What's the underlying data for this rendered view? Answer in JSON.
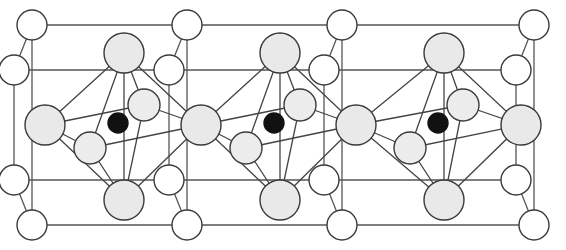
{
  "figure": {
    "kind": "ball-and-stick unit-cell packing diagram",
    "background_color": "#ffffff",
    "width": 566,
    "height": 250
  },
  "style": {
    "lattice_line_color": "#555555",
    "lattice_line_width": 1.3,
    "bond_line_color": "#444444",
    "bond_line_width": 1.3,
    "atom_outline_color": "#3a3a3a",
    "atom_outline_width": 1.4
  },
  "atom_types": [
    {
      "id": "large-gray",
      "label": "Large gray sphere",
      "fill": "#e9e9e9",
      "stroke": "#3a3a3a",
      "radius": 20
    },
    {
      "id": "medium-gray",
      "label": "Medium gray sphere",
      "fill": "#ececec",
      "stroke": "#3a3a3a",
      "radius": 16
    },
    {
      "id": "white",
      "label": "Small white sphere",
      "fill": "#ffffff",
      "stroke": "#3a3a3a",
      "radius": 15
    },
    {
      "id": "black",
      "label": "Small black sphere",
      "fill": "#111111",
      "stroke": "#111111",
      "radius": 10
    }
  ],
  "lattice_lines": [
    {
      "name": "top-edge",
      "x1": 32,
      "y1": 25,
      "x2": 534,
      "y2": 25
    },
    {
      "name": "upper-inner-edge",
      "x1": 14,
      "y1": 70,
      "x2": 516,
      "y2": 70
    },
    {
      "name": "lower-inner-edge",
      "x1": 14,
      "y1": 180,
      "x2": 516,
      "y2": 180
    },
    {
      "name": "bottom-edge",
      "x1": 32,
      "y1": 225,
      "x2": 534,
      "y2": 225
    },
    {
      "name": "left-vertical-back",
      "x1": 32,
      "y1": 25,
      "x2": 32,
      "y2": 225
    },
    {
      "name": "left-vertical-front",
      "x1": 14,
      "y1": 70,
      "x2": 14,
      "y2": 180
    },
    {
      "name": "right-vertical-back",
      "x1": 534,
      "y1": 25,
      "x2": 534,
      "y2": 225
    },
    {
      "name": "right-vertical-front",
      "x1": 516,
      "y1": 70,
      "x2": 516,
      "y2": 180
    },
    {
      "name": "mid-vertical-1-back",
      "x1": 187,
      "y1": 25,
      "x2": 187,
      "y2": 225
    },
    {
      "name": "mid-vertical-1-front",
      "x1": 169,
      "y1": 70,
      "x2": 169,
      "y2": 180
    },
    {
      "name": "mid-vertical-2-back",
      "x1": 342,
      "y1": 25,
      "x2": 342,
      "y2": 225
    },
    {
      "name": "mid-vertical-2-front",
      "x1": 324,
      "y1": 70,
      "x2": 324,
      "y2": 180
    },
    {
      "name": "depth-left-top",
      "x1": 32,
      "y1": 25,
      "x2": 14,
      "y2": 70
    },
    {
      "name": "depth-left-bottom",
      "x1": 32,
      "y1": 225,
      "x2": 14,
      "y2": 180
    },
    {
      "name": "depth-right-top",
      "x1": 534,
      "y1": 25,
      "x2": 516,
      "y2": 70
    },
    {
      "name": "depth-right-bottom",
      "x1": 534,
      "y1": 225,
      "x2": 516,
      "y2": 180
    },
    {
      "name": "depth-mid1-top",
      "x1": 187,
      "y1": 25,
      "x2": 169,
      "y2": 70
    },
    {
      "name": "depth-mid1-bottom",
      "x1": 187,
      "y1": 225,
      "x2": 169,
      "y2": 180
    },
    {
      "name": "depth-mid2-top",
      "x1": 342,
      "y1": 25,
      "x2": 324,
      "y2": 70
    },
    {
      "name": "depth-mid2-bottom",
      "x1": 342,
      "y1": 225,
      "x2": 324,
      "y2": 180
    }
  ],
  "atoms": [
    {
      "name": "corner-white-top-left",
      "type": "white",
      "cx": 32,
      "cy": 25
    },
    {
      "name": "corner-white-top-mid1",
      "type": "white",
      "cx": 187,
      "cy": 25
    },
    {
      "name": "corner-white-top-mid2",
      "type": "white",
      "cx": 342,
      "cy": 25
    },
    {
      "name": "corner-white-top-right",
      "type": "white",
      "cx": 534,
      "cy": 25
    },
    {
      "name": "corner-white-upper-left",
      "type": "white",
      "cx": 14,
      "cy": 70
    },
    {
      "name": "corner-white-upper-mid1",
      "type": "white",
      "cx": 169,
      "cy": 70
    },
    {
      "name": "corner-white-upper-mid2",
      "type": "white",
      "cx": 324,
      "cy": 70
    },
    {
      "name": "corner-white-upper-right",
      "type": "white",
      "cx": 516,
      "cy": 70
    },
    {
      "name": "corner-white-lower-left",
      "type": "white",
      "cx": 14,
      "cy": 180
    },
    {
      "name": "corner-white-lower-mid1",
      "type": "white",
      "cx": 169,
      "cy": 180
    },
    {
      "name": "corner-white-lower-mid2",
      "type": "white",
      "cx": 324,
      "cy": 180
    },
    {
      "name": "corner-white-lower-right",
      "type": "white",
      "cx": 516,
      "cy": 180
    },
    {
      "name": "corner-white-bottom-left",
      "type": "white",
      "cx": 32,
      "cy": 225
    },
    {
      "name": "corner-white-bottom-mid1",
      "type": "white",
      "cx": 187,
      "cy": 225
    },
    {
      "name": "corner-white-bottom-mid2",
      "type": "white",
      "cx": 342,
      "cy": 225
    },
    {
      "name": "corner-white-bottom-right",
      "type": "white",
      "cx": 534,
      "cy": 225
    },
    {
      "name": "hub-gray-left-edge",
      "type": "large-gray",
      "cx": 45,
      "cy": 125
    },
    {
      "name": "hub-gray-mid1",
      "type": "large-gray",
      "cx": 201,
      "cy": 125
    },
    {
      "name": "hub-gray-mid2",
      "type": "large-gray",
      "cx": 356,
      "cy": 125
    },
    {
      "name": "hub-gray-right-edge",
      "type": "large-gray",
      "cx": 521,
      "cy": 125
    },
    {
      "name": "apex-gray-cell1",
      "type": "large-gray",
      "cx": 124,
      "cy": 53
    },
    {
      "name": "apex-gray-cell2",
      "type": "large-gray",
      "cx": 280,
      "cy": 53
    },
    {
      "name": "apex-gray-cell3",
      "type": "large-gray",
      "cx": 444,
      "cy": 53
    },
    {
      "name": "base-gray-cell1",
      "type": "large-gray",
      "cx": 124,
      "cy": 200
    },
    {
      "name": "base-gray-cell2",
      "type": "large-gray",
      "cx": 280,
      "cy": 200
    },
    {
      "name": "base-gray-cell3",
      "type": "large-gray",
      "cx": 444,
      "cy": 200
    },
    {
      "name": "inner-gray-upper-cell1",
      "type": "medium-gray",
      "cx": 144,
      "cy": 105
    },
    {
      "name": "inner-gray-upper-cell2",
      "type": "medium-gray",
      "cx": 300,
      "cy": 105
    },
    {
      "name": "inner-gray-upper-cell3",
      "type": "medium-gray",
      "cx": 463,
      "cy": 105
    },
    {
      "name": "inner-gray-lower-cell1",
      "type": "medium-gray",
      "cx": 90,
      "cy": 148
    },
    {
      "name": "inner-gray-lower-cell2",
      "type": "medium-gray",
      "cx": 246,
      "cy": 148
    },
    {
      "name": "inner-gray-lower-cell3",
      "type": "medium-gray",
      "cx": 410,
      "cy": 148
    },
    {
      "name": "center-black-cell1",
      "type": "black",
      "cx": 118,
      "cy": 123
    },
    {
      "name": "center-black-cell2",
      "type": "black",
      "cx": 274,
      "cy": 123
    },
    {
      "name": "center-black-cell3",
      "type": "black",
      "cx": 438,
      "cy": 123
    }
  ],
  "bonds": [
    {
      "name": "bond-c1-apex-hubL",
      "x1": 124,
      "y1": 53,
      "x2": 45,
      "y2": 125
    },
    {
      "name": "bond-c1-apex-hubR",
      "x1": 124,
      "y1": 53,
      "x2": 201,
      "y2": 125
    },
    {
      "name": "bond-c1-apex-innerUp",
      "x1": 124,
      "y1": 53,
      "x2": 144,
      "y2": 105
    },
    {
      "name": "bond-c1-apex-innerLo",
      "x1": 124,
      "y1": 53,
      "x2": 90,
      "y2": 148
    },
    {
      "name": "bond-c1-apex-base",
      "x1": 124,
      "y1": 53,
      "x2": 124,
      "y2": 200
    },
    {
      "name": "bond-c1-base-hubL",
      "x1": 124,
      "y1": 200,
      "x2": 45,
      "y2": 125
    },
    {
      "name": "bond-c1-base-hubR",
      "x1": 124,
      "y1": 200,
      "x2": 201,
      "y2": 125
    },
    {
      "name": "bond-c1-base-innerUp",
      "x1": 124,
      "y1": 200,
      "x2": 144,
      "y2": 105
    },
    {
      "name": "bond-c1-base-innerLo",
      "x1": 124,
      "y1": 200,
      "x2": 90,
      "y2": 148
    },
    {
      "name": "bond-c1-hubL-innerUp",
      "x1": 45,
      "y1": 125,
      "x2": 144,
      "y2": 105
    },
    {
      "name": "bond-c1-hubL-innerLo",
      "x1": 45,
      "y1": 125,
      "x2": 90,
      "y2": 148
    },
    {
      "name": "bond-c1-hubR-innerUp",
      "x1": 201,
      "y1": 125,
      "x2": 144,
      "y2": 105
    },
    {
      "name": "bond-c1-hubR-innerLo",
      "x1": 201,
      "y1": 125,
      "x2": 90,
      "y2": 148
    },
    {
      "name": "bond-c2-apex-hubL",
      "x1": 280,
      "y1": 53,
      "x2": 201,
      "y2": 125
    },
    {
      "name": "bond-c2-apex-hubR",
      "x1": 280,
      "y1": 53,
      "x2": 356,
      "y2": 125
    },
    {
      "name": "bond-c2-apex-innerUp",
      "x1": 280,
      "y1": 53,
      "x2": 300,
      "y2": 105
    },
    {
      "name": "bond-c2-apex-innerLo",
      "x1": 280,
      "y1": 53,
      "x2": 246,
      "y2": 148
    },
    {
      "name": "bond-c2-apex-base",
      "x1": 280,
      "y1": 53,
      "x2": 280,
      "y2": 200
    },
    {
      "name": "bond-c2-base-hubL",
      "x1": 280,
      "y1": 200,
      "x2": 201,
      "y2": 125
    },
    {
      "name": "bond-c2-base-hubR",
      "x1": 280,
      "y1": 200,
      "x2": 356,
      "y2": 125
    },
    {
      "name": "bond-c2-base-innerUp",
      "x1": 280,
      "y1": 200,
      "x2": 300,
      "y2": 105
    },
    {
      "name": "bond-c2-base-innerLo",
      "x1": 280,
      "y1": 200,
      "x2": 246,
      "y2": 148
    },
    {
      "name": "bond-c2-hubL-innerUp",
      "x1": 201,
      "y1": 125,
      "x2": 300,
      "y2": 105
    },
    {
      "name": "bond-c2-hubL-innerLo",
      "x1": 201,
      "y1": 125,
      "x2": 246,
      "y2": 148
    },
    {
      "name": "bond-c2-hubR-innerUp",
      "x1": 356,
      "y1": 125,
      "x2": 300,
      "y2": 105
    },
    {
      "name": "bond-c2-hubR-innerLo",
      "x1": 356,
      "y1": 125,
      "x2": 246,
      "y2": 148
    },
    {
      "name": "bond-c3-apex-hubL",
      "x1": 444,
      "y1": 53,
      "x2": 356,
      "y2": 125
    },
    {
      "name": "bond-c3-apex-hubR",
      "x1": 444,
      "y1": 53,
      "x2": 521,
      "y2": 125
    },
    {
      "name": "bond-c3-apex-innerUp",
      "x1": 444,
      "y1": 53,
      "x2": 463,
      "y2": 105
    },
    {
      "name": "bond-c3-apex-innerLo",
      "x1": 444,
      "y1": 53,
      "x2": 410,
      "y2": 148
    },
    {
      "name": "bond-c3-apex-base",
      "x1": 444,
      "y1": 53,
      "x2": 444,
      "y2": 200
    },
    {
      "name": "bond-c3-base-hubL",
      "x1": 444,
      "y1": 200,
      "x2": 356,
      "y2": 125
    },
    {
      "name": "bond-c3-base-hubR",
      "x1": 444,
      "y1": 200,
      "x2": 521,
      "y2": 125
    },
    {
      "name": "bond-c3-base-innerUp",
      "x1": 444,
      "y1": 200,
      "x2": 463,
      "y2": 105
    },
    {
      "name": "bond-c3-base-innerLo",
      "x1": 444,
      "y1": 200,
      "x2": 410,
      "y2": 148
    },
    {
      "name": "bond-c3-hubL-innerUp",
      "x1": 356,
      "y1": 125,
      "x2": 463,
      "y2": 105
    },
    {
      "name": "bond-c3-hubL-innerLo",
      "x1": 356,
      "y1": 125,
      "x2": 410,
      "y2": 148
    },
    {
      "name": "bond-c3-hubR-innerUp",
      "x1": 521,
      "y1": 125,
      "x2": 463,
      "y2": 105
    },
    {
      "name": "bond-c3-hubR-innerLo",
      "x1": 521,
      "y1": 125,
      "x2": 410,
      "y2": 148
    }
  ]
}
